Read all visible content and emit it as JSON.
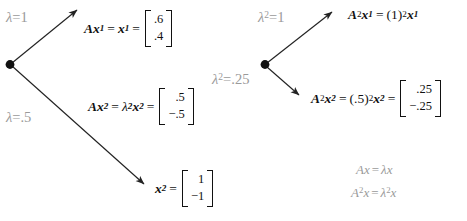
{
  "figure": {
    "colors": {
      "annotation_gray": "#9a9a9a",
      "equation_black": "#111111",
      "arrow": "#222222",
      "background": "#ffffff"
    },
    "left_group": {
      "origin_label": "origin-dot-left",
      "annotations": [
        {
          "id": "lambda-1",
          "lambda": "λ",
          "op": "=",
          "value": "1"
        },
        {
          "id": "lambda-half",
          "lambda": "λ",
          "op": "=",
          "value": ".5"
        }
      ],
      "equations": [
        {
          "id": "Ax1",
          "lhs_A": "A",
          "lhs_x": "x",
          "lhs_sub": "1",
          "eq1": "=",
          "mid_x": "x",
          "mid_sub": "1",
          "eq2": "=",
          "matrix": [
            ".6",
            ".4"
          ]
        },
        {
          "id": "Ax2",
          "lhs_A": "A",
          "lhs_x": "x",
          "lhs_sub": "2",
          "eq1": "=",
          "mid_lambda": "λ",
          "mid_lambda_sub": "2",
          "mid_x": "x",
          "mid_sub": "2",
          "eq2": "=",
          "matrix": [
            ".5",
            "−.5"
          ]
        },
        {
          "id": "x2",
          "lhs_x": "x",
          "lhs_sub": "2",
          "eq1": "=",
          "matrix": [
            "1",
            "−1"
          ]
        }
      ]
    },
    "right_group": {
      "origin_label": "origin-dot-right",
      "annotations": [
        {
          "id": "lambda-sq-1",
          "lambda": "λ",
          "sup": "2",
          "op": "=",
          "value": "1"
        },
        {
          "id": "lambda-sq-quarter",
          "lambda": "λ",
          "sup": "2",
          "op": "=",
          "value": ".25"
        }
      ],
      "equations": [
        {
          "id": "A2x1",
          "lhs_A": "A",
          "lhs_A_sup": "2",
          "lhs_x": "x",
          "lhs_sub": "1",
          "eq1": "=",
          "coef": "(1)",
          "coef_sup": "2",
          "mid_x": "x",
          "mid_sub": "1"
        },
        {
          "id": "A2x2",
          "lhs_A": "A",
          "lhs_A_sup": "2",
          "lhs_x": "x",
          "lhs_sub": "2",
          "eq1": "=",
          "coef": "(.5)",
          "coef_sup": "2",
          "mid_x": "x",
          "mid_sub": "2",
          "eq2": "=",
          "matrix": [
            ".25",
            "−.25"
          ]
        }
      ]
    },
    "footnote_formulas": [
      {
        "id": "Ax-eq-lambda-x",
        "A": "A",
        "x1": "x",
        "op": "=",
        "lambda": "λ",
        "x2": "x"
      },
      {
        "id": "A2x-eq-lambda2-x",
        "A": "A",
        "A_sup": "2",
        "x1": "x",
        "op": "=",
        "lambda": "λ",
        "lambda_sup": "2",
        "x2": "x"
      }
    ]
  }
}
